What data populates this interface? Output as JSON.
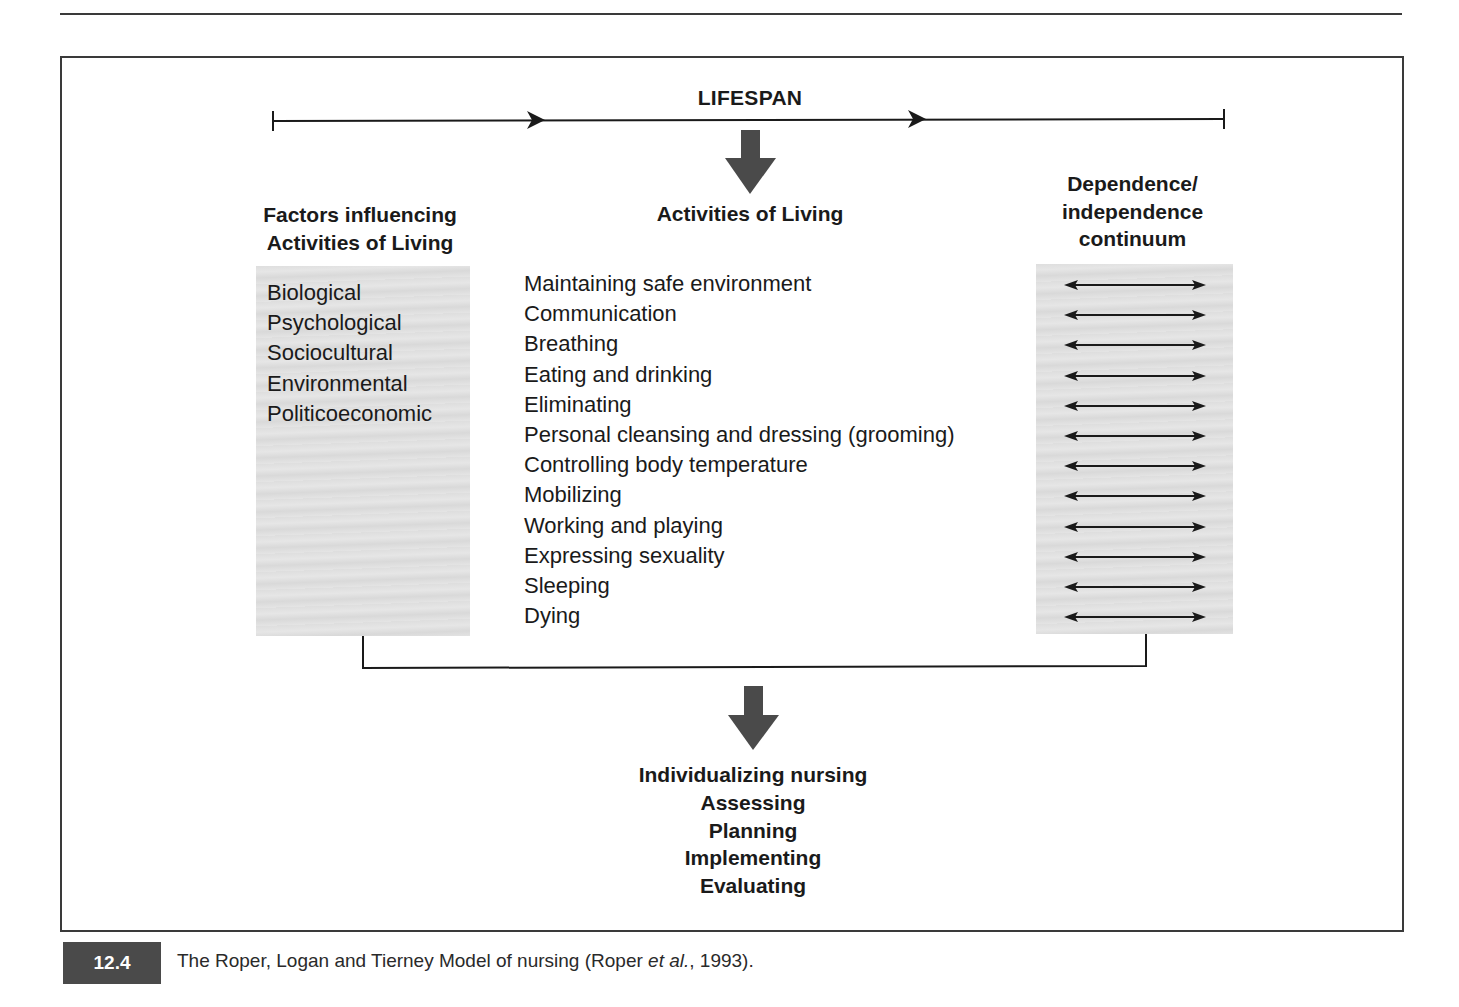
{
  "diagram": {
    "lifespan": {
      "label": "LIFESPAN"
    },
    "factors": {
      "heading_line1": "Factors influencing",
      "heading_line2": "Activities of Living",
      "items": [
        "Biological",
        "Psychological",
        "Sociocultural",
        "Environmental",
        "Politicoeconomic"
      ]
    },
    "activities": {
      "heading": "Activities of Living",
      "items": [
        "Maintaining safe environment",
        "Communication",
        "Breathing",
        "Eating and drinking",
        "Eliminating",
        "Personal cleansing and dressing (grooming)",
        "Controlling body temperature",
        "Mobilizing",
        "Working and playing",
        "Expressing sexuality",
        "Sleeping",
        "Dying"
      ]
    },
    "continuum": {
      "heading_line1": "Dependence/",
      "heading_line2": "independence",
      "heading_line3": "continuum",
      "arrow_count": 12,
      "arrow_icon": "double-headed-arrow-icon"
    },
    "outcome": {
      "items": [
        "Individualizing nursing",
        "Assessing",
        "Planning",
        "Implementing",
        "Evaluating"
      ]
    },
    "colors": {
      "line": "#1a1a1a",
      "block_arrow": "#4a4a4a",
      "shaded_box": "#e0e0e0",
      "frame": "#3a3a3a"
    }
  },
  "caption": {
    "figure_number": "12.4",
    "text_before_italic": "The Roper, Logan and Tierney Model of nursing (Roper ",
    "text_italic": "et al.",
    "text_after_italic": ", 1993)."
  }
}
